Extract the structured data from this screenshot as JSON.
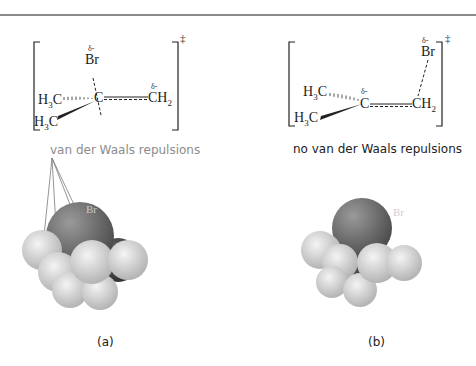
{
  "figure": {
    "panels": [
      {
        "id": "a",
        "label": "(a)",
        "caption": "van der Waals repulsions",
        "caption_color": "#8c8c8c",
        "structure": {
          "top_atom": "Br",
          "top_atom_charge": "δ-",
          "center_atom": "C",
          "right_group": "CH",
          "right_group_sub": "2",
          "right_group_charge": "δ-",
          "methyl_upper": "H",
          "methyl_upper_sub": "3",
          "methyl_upper_c": "C",
          "methyl_lower": "H",
          "methyl_lower_sub": "3",
          "methyl_lower_c": "C",
          "ts_symbol": "‡"
        },
        "model_atom_label": "Br"
      },
      {
        "id": "b",
        "label": "(b)",
        "caption": "no van der Waals repulsions",
        "caption_color": "#222222",
        "structure": {
          "top_atom": "Br",
          "top_atom_charge": "δ-",
          "center_atom": "C",
          "center_atom_charge": "δ-",
          "right_group": "CH",
          "right_group_sub": "2",
          "methyl_upper": "H",
          "methyl_upper_sub": "3",
          "methyl_upper_c": "C",
          "methyl_lower": "H",
          "methyl_lower_sub": "3",
          "methyl_lower_c": "C",
          "ts_symbol": "‡"
        },
        "model_atom_label": "Br"
      }
    ],
    "colors": {
      "bromine": "#6a6a6a",
      "carbon": "#4a4a4a",
      "hydrogen": "#d8d8d8",
      "ink": "#222222"
    }
  }
}
